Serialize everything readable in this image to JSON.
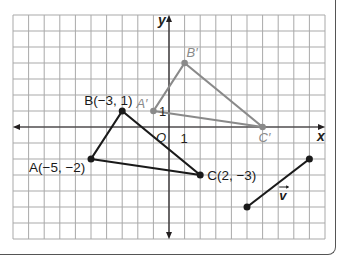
{
  "diagram": {
    "type": "coordinate-plane-translation",
    "grid": {
      "x_min": -10,
      "x_max": 10,
      "y_min": -7,
      "y_max": 7,
      "origin_px": [
        169,
        127
      ],
      "cell_px_x": 15.6,
      "cell_px_y": 16,
      "line_color": "#a9a9a9"
    },
    "axes": {
      "x_label": "x",
      "y_label": "y",
      "origin_label": "O",
      "x_tick_label": "1",
      "y_tick_label": "1",
      "color": "#231f20"
    },
    "original_triangle": {
      "color": "#1a1a1a",
      "vertices": [
        {
          "name": "A",
          "x": -5,
          "y": -2,
          "label": "A(−5, −2)"
        },
        {
          "name": "B",
          "x": -3,
          "y": 1,
          "label": "B(−3, 1)"
        },
        {
          "name": "C",
          "x": 2,
          "y": -3,
          "label": "C(2, −3)"
        }
      ]
    },
    "image_triangle": {
      "color": "#8a8a8a",
      "vertices": [
        {
          "name": "A'",
          "x": -1,
          "y": 1,
          "label": "A′"
        },
        {
          "name": "B'",
          "x": 1,
          "y": 4,
          "label": "B′"
        },
        {
          "name": "C'",
          "x": 6,
          "y": 0,
          "label": "C′"
        }
      ]
    },
    "vector": {
      "label": "v",
      "start": {
        "x": 5,
        "y": -5
      },
      "end": {
        "x": 9,
        "y": -2
      },
      "color": "#1a1a1a"
    }
  }
}
